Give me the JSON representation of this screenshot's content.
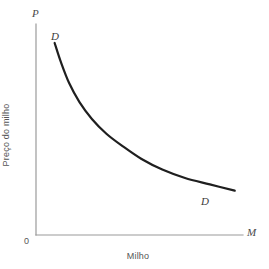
{
  "chart_data": {
    "type": "line",
    "title": "",
    "subtitle": "",
    "xlabel": "Milho",
    "ylabel": "Preço do milho",
    "origin_label": "0",
    "x_axis_symbol": "M",
    "y_axis_symbol": "P",
    "grid": false,
    "legend_position": "inline-endpoints",
    "xlim": [
      0,
      100
    ],
    "ylim": [
      0,
      100
    ],
    "axis_tick_labels": {
      "x": [],
      "y": []
    },
    "series": [
      {
        "name": "D",
        "label_start": "D",
        "label_end": "D",
        "description": "Curva de demanda decrescente (hiperbólica) do milho",
        "color": "#1f1f1f",
        "x": [
          9,
          12,
          16,
          21,
          27,
          34,
          42,
          51,
          61,
          72,
          84,
          96
        ],
        "y": [
          91,
          82,
          72,
          63,
          55,
          48,
          42,
          36,
          31,
          27,
          24,
          21
        ]
      }
    ],
    "annotations": [
      {
        "text": "D",
        "position": "curve-upper-left"
      },
      {
        "text": "D",
        "position": "curve-lower-right"
      }
    ]
  },
  "colors": {
    "curve": "#1f1f1f",
    "axis": "#9a9a9a",
    "text": "#555555",
    "symbol": "#4a4a4a",
    "background": "#ffffff"
  }
}
